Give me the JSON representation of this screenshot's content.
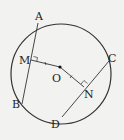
{
  "diagram": {
    "type": "geometry-circle-chords",
    "labels": {
      "A": "A",
      "B": "B",
      "C": "C",
      "D": "D",
      "M": "M",
      "N": "N",
      "O": "O"
    },
    "colors": {
      "stroke": "#333333",
      "background": "#f2f2f0"
    }
  }
}
